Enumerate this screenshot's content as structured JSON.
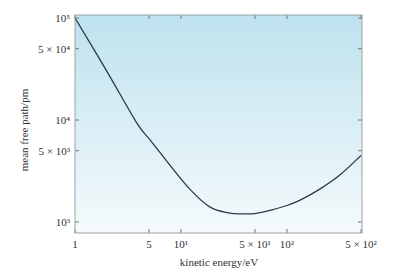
{
  "chart_data": {
    "type": "line",
    "title": "",
    "xlabel": "kinetic energy/eV",
    "ylabel": "mean free path/pm",
    "xscale": "log",
    "yscale": "log",
    "xlim": [
      1,
      500
    ],
    "ylim": [
      900,
      100000
    ],
    "grid": false,
    "legend": null,
    "x_ticks": [
      {
        "value": 1,
        "label": "1"
      },
      {
        "value": 5,
        "label": "5"
      },
      {
        "value": 10,
        "label": "10¹"
      },
      {
        "value": 50,
        "label": "5 × 10¹"
      },
      {
        "value": 100,
        "label": "10²"
      },
      {
        "value": 500,
        "label": "5 × 10²"
      }
    ],
    "y_ticks": [
      {
        "value": 1000,
        "label": "10³"
      },
      {
        "value": 5000,
        "label": "5 × 10³"
      },
      {
        "value": 10000,
        "label": "10⁴"
      },
      {
        "value": 50000,
        "label": "5 × 10⁴"
      },
      {
        "value": 100000,
        "label": "10⁵"
      }
    ],
    "series": [
      {
        "name": "mean free path",
        "color": "#2b3a4a",
        "x": [
          1,
          2,
          3.84,
          5.1,
          7.9,
          12.1,
          18.8,
          28,
          38,
          50,
          69,
          100,
          133,
          204,
          317,
          500
        ],
        "y": [
          100000,
          30000,
          9300,
          6400,
          3600,
          2100,
          1400,
          1230,
          1200,
          1210,
          1300,
          1450,
          1640,
          2100,
          2900,
          4500
        ]
      }
    ],
    "background_gradient": {
      "top": "#bde2ee",
      "bottom": "#f5fafc"
    }
  }
}
